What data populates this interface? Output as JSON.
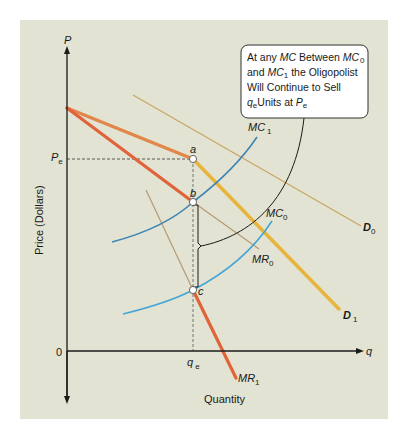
{
  "colors": {
    "panel_bg": "#e2e3d2",
    "axis": "#1a1a1a",
    "mr1_thick": "#e0633a",
    "kink_demand": "#e2874a",
    "d1": "#e8b43c",
    "d0_thin": "#c9a464",
    "mr_thin": "#b69a74",
    "mc1": "#3f84b4",
    "mc0": "#45a6d6",
    "callout_border": "#333333",
    "callout_bg": "#ffffff"
  },
  "axes": {
    "y_label": "P",
    "y_title": "Price (Dollars)",
    "x_label": "q",
    "x_title": "Quantity",
    "origin": "0",
    "pe_main": "P",
    "pe_sub": "e",
    "qe_main": "q",
    "qe_sub": "e"
  },
  "points": {
    "a": "a",
    "b": "b",
    "c": "c"
  },
  "curves": {
    "mc1_main": "MC",
    "mc1_sub": "1",
    "mc0_main": "MC",
    "mc0_sub": "0",
    "d0_main": "D",
    "d0_sub": "0",
    "d1_main": "D",
    "d1_sub": "1",
    "mr0_main": "MR",
    "mr0_sub": "0",
    "mr1_main": "MR",
    "mr1_sub": "1"
  },
  "callout": {
    "line1_a": "At any ",
    "line1_b": "MC",
    "line1_c": " Between ",
    "line1_d": "MC",
    "line1_e": "0",
    "line2_a": "and ",
    "line2_b": "MC",
    "line2_c": "1",
    "line2_d": " the Oligopolist",
    "line3": "Will Continue to Sell",
    "line4_a": "q",
    "line4_b": "e",
    "line4_c": "Units at ",
    "line4_d": "P",
    "line4_e": "e"
  }
}
